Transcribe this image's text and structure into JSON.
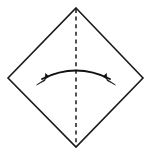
{
  "figure": {
    "background_color": "#ffffff",
    "stroke_color": "#1a1a1a",
    "arrow_color": "#111111",
    "canvas": {
      "width": 151,
      "height": 155
    },
    "shape": {
      "name": "square rotated 45 degrees (diamond)",
      "points": "76,8 143,78 76,147 8,78",
      "vertices": [
        {
          "label": "top",
          "x": 76,
          "y": 8
        },
        {
          "label": "right",
          "x": 143,
          "y": 78
        },
        {
          "label": "bottom",
          "x": 76,
          "y": 147
        },
        {
          "label": "left",
          "x": 8,
          "y": 78
        }
      ]
    },
    "symmetry_axis": {
      "name": "vertical dashed fold line",
      "orientation": "vertical",
      "path": "M 76 9 L 76 146",
      "dash_pattern": "4 3.6"
    },
    "arc_arrow": {
      "name": "double-headed curved fold arrow",
      "direction": "bidirectional",
      "path": "M 42 79 Q 76 62 110 79",
      "left_head": {
        "points": "36.5,85 49,76.5 45.5,73.5 45,80.5",
        "tip_x": 36.5,
        "tip_y": 85
      },
      "right_head": {
        "points": "115.5,85 103,76.5 106.5,73.5 107,80.5",
        "tip_x": 115.5,
        "tip_y": 85
      }
    }
  }
}
